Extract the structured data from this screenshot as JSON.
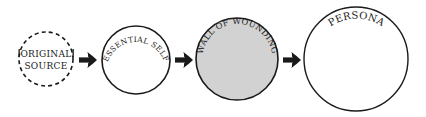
{
  "diagram": {
    "nodes": [
      {
        "id": "original-source",
        "line1": "ORIGINAL",
        "line2": "SOURCE",
        "style": "dashed",
        "fill": "#ffffff"
      },
      {
        "id": "essential-self",
        "label": "ESSENTIAL SELF",
        "style": "solid",
        "fill": "#ffffff"
      },
      {
        "id": "wall-of-wounding",
        "label": "WALL OF WOUNDING",
        "style": "solid",
        "fill": "#d2d2d2"
      },
      {
        "id": "persona",
        "label": "PERSONA",
        "style": "solid",
        "fill": "#ffffff"
      }
    ],
    "arrows": [
      {
        "from": "original-source",
        "to": "essential-self"
      },
      {
        "from": "essential-self",
        "to": "wall-of-wounding"
      },
      {
        "from": "wall-of-wounding",
        "to": "persona"
      }
    ],
    "colors": {
      "stroke": "#1a1a1a",
      "shaded": "#d2d2d2",
      "background": "#ffffff"
    }
  }
}
